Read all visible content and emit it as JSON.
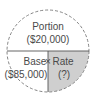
{
  "diagram": {
    "top": {
      "title": "Portion",
      "value": "($20,000)"
    },
    "bottom_left": {
      "title": "Base",
      "value": "($85,000)"
    },
    "operator": "×",
    "bottom_right": {
      "title": "Rate",
      "value": "(?)"
    },
    "colors": {
      "shade": "#cfcfcf",
      "line": "#555555",
      "dash": "#777777",
      "text": "#4a4a4a"
    }
  }
}
